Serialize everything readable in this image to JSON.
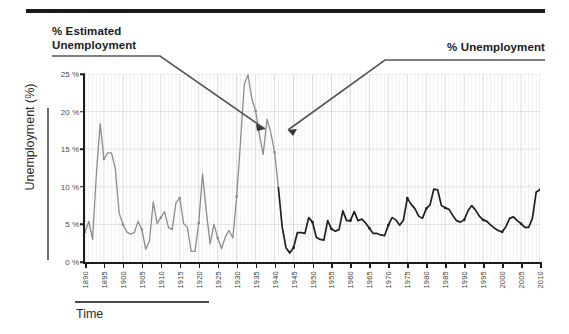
{
  "figure": {
    "top_rule": "",
    "annotations": [
      {
        "name": "estimated-series-label",
        "text": "% Estimated\nUnemployment",
        "line1": "% Estimated",
        "line2": "Unemployment"
      },
      {
        "name": "official-series-label",
        "text": "% Unemployment",
        "line1": "% Unemployment"
      }
    ],
    "axis_bracket_labels": {
      "y_bracket_label": "Unemployment (%)",
      "x_bracket_label": "Time"
    }
  },
  "chart_data": {
    "type": "line",
    "title": "",
    "subtitle": "",
    "xlabel": "Time",
    "ylabel": "Unemployment (%)",
    "xlim": [
      1890,
      2010
    ],
    "ylim": [
      0,
      25
    ],
    "grid": true,
    "legend_position": "annotations-with-leader-lines",
    "y_ticks": [
      0,
      5,
      10,
      15,
      20,
      25
    ],
    "y_tick_labels": [
      "0 %",
      "5 %",
      "10 %",
      "15 %",
      "20 %",
      "25 %"
    ],
    "x_ticks": [
      1890,
      1895,
      1900,
      1905,
      1910,
      1915,
      1920,
      1925,
      1930,
      1935,
      1940,
      1945,
      1950,
      1955,
      1960,
      1965,
      1970,
      1975,
      1980,
      1985,
      1990,
      1995,
      2000,
      2005,
      2010
    ],
    "x_tick_labels": [
      "1890",
      "1895",
      "1900",
      "1905",
      "1910",
      "1915",
      "1920",
      "1925",
      "1930",
      "1935",
      "1940",
      "1945",
      "1950",
      "1955",
      "1960",
      "1965",
      "1970",
      "1975",
      "1980",
      "1985",
      "1990",
      "1995",
      "2000",
      "2005",
      "2010"
    ],
    "series": [
      {
        "name": "% Estimated Unemployment",
        "color": "#8c8c8c",
        "marker": "square",
        "x": [
          1890,
          1891,
          1892,
          1893,
          1894,
          1895,
          1896,
          1897,
          1898,
          1899,
          1900,
          1901,
          1902,
          1903,
          1904,
          1905,
          1906,
          1907,
          1908,
          1909,
          1910,
          1911,
          1912,
          1913,
          1914,
          1915,
          1916,
          1917,
          1918,
          1919,
          1920,
          1921,
          1922,
          1923,
          1924,
          1925,
          1926,
          1927,
          1928,
          1929,
          1930,
          1931,
          1932,
          1933,
          1934,
          1935,
          1936,
          1937,
          1938,
          1939,
          1940,
          1941
        ],
        "values": [
          4.0,
          5.4,
          3.0,
          11.7,
          18.4,
          13.7,
          14.5,
          14.5,
          12.4,
          6.5,
          5.0,
          4.0,
          3.7,
          3.9,
          5.4,
          4.3,
          1.7,
          2.8,
          8.0,
          5.1,
          5.9,
          6.7,
          4.6,
          4.3,
          7.9,
          8.5,
          5.1,
          4.6,
          1.4,
          1.4,
          5.2,
          11.7,
          6.7,
          2.4,
          5.0,
          3.2,
          1.8,
          3.3,
          4.2,
          3.2,
          8.7,
          15.9,
          23.6,
          24.9,
          21.7,
          20.1,
          16.9,
          14.3,
          19.0,
          17.2,
          14.6,
          9.9
        ]
      },
      {
        "name": "% Unemployment",
        "color": "#1f1f1f",
        "marker": "square",
        "x": [
          1941,
          1942,
          1943,
          1944,
          1945,
          1946,
          1947,
          1948,
          1949,
          1950,
          1951,
          1952,
          1953,
          1954,
          1955,
          1956,
          1957,
          1958,
          1959,
          1960,
          1961,
          1962,
          1963,
          1964,
          1965,
          1966,
          1967,
          1968,
          1969,
          1970,
          1971,
          1972,
          1973,
          1974,
          1975,
          1976,
          1977,
          1978,
          1979,
          1980,
          1981,
          1982,
          1983,
          1984,
          1985,
          1986,
          1987,
          1988,
          1989,
          1990,
          1991,
          1992,
          1993,
          1994,
          1995,
          1996,
          1997,
          1998,
          1999,
          2000,
          2001,
          2002,
          2003,
          2004,
          2005,
          2006,
          2007,
          2008,
          2009,
          2010
        ],
        "values": [
          9.9,
          4.7,
          1.9,
          1.2,
          1.9,
          3.9,
          3.9,
          3.8,
          5.9,
          5.3,
          3.3,
          3.0,
          2.9,
          5.5,
          4.4,
          4.1,
          4.3,
          6.8,
          5.5,
          5.5,
          6.7,
          5.5,
          5.7,
          5.2,
          4.5,
          3.8,
          3.8,
          3.6,
          3.5,
          4.9,
          5.9,
          5.6,
          4.9,
          5.6,
          8.5,
          7.7,
          7.1,
          6.1,
          5.8,
          7.1,
          7.6,
          9.7,
          9.6,
          7.5,
          7.2,
          7.0,
          6.2,
          5.5,
          5.3,
          5.6,
          6.8,
          7.5,
          6.9,
          6.1,
          5.6,
          5.4,
          4.9,
          4.5,
          4.2,
          4.0,
          4.7,
          5.8,
          6.0,
          5.5,
          5.1,
          4.6,
          4.6,
          5.8,
          9.3,
          9.6
        ]
      }
    ],
    "notable_points": [
      {
        "label": "1890s depression peak",
        "year": 1894,
        "value": 18.4
      },
      {
        "label": "Great Depression peak",
        "year": 1933,
        "value": 24.9
      },
      {
        "label": "WWII low",
        "year": 1944,
        "value": 1.2
      },
      {
        "label": "1982 recession peak",
        "year": 1982,
        "value": 9.7
      },
      {
        "label": "Great Recession peak",
        "year": 2010,
        "value": 9.6
      }
    ]
  },
  "colors": {
    "estimated_series": "#8c8c8c",
    "official_series": "#1f1f1f",
    "axis": "#1c1c1c",
    "grid": "#dcdcdc",
    "leader_line": "#555555",
    "top_rule": "#1a1a1a"
  }
}
